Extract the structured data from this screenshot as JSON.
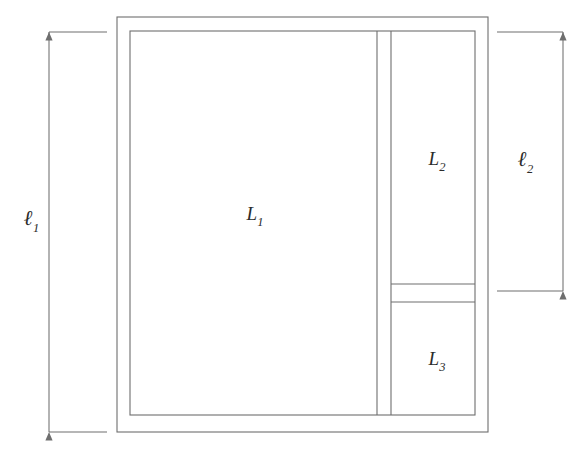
{
  "figure": {
    "type": "architectural-floor-plan",
    "background_color": "#ffffff",
    "line_color": "#6e6e6e",
    "text_color": "#2b2b2b",
    "rooms": [
      {
        "id": "L1",
        "name": "room-l1",
        "label": "L",
        "subscript": "1",
        "label_x": 255,
        "label_y": 220
      },
      {
        "id": "L2",
        "name": "room-l2",
        "label": "L",
        "subscript": "2",
        "label_x": 437,
        "label_y": 165
      },
      {
        "id": "L3",
        "name": "room-l3",
        "label": "L",
        "subscript": "3",
        "label_x": 437,
        "label_y": 365
      }
    ],
    "dimensions": [
      {
        "id": "l1",
        "name": "dimension-l1",
        "label": "ℓ",
        "subscript": "1",
        "orientation": "vertical",
        "side": "left",
        "label_x": 28,
        "label_y": 225,
        "line_x": 49,
        "from_y": 32,
        "to_y": 432,
        "extension_from_x": 49,
        "extension_to_x": 107
      },
      {
        "id": "l2",
        "name": "dimension-l2",
        "label": "ℓ",
        "subscript": "2",
        "orientation": "vertical",
        "side": "right",
        "label_x": 524,
        "label_y": 166,
        "line_x": 563,
        "from_y": 32,
        "to_y": 291,
        "extension_from_x": 497,
        "extension_to_x": 563
      }
    ],
    "geometry": {
      "outer_left": 117,
      "outer_right": 488,
      "outer_top": 17,
      "outer_bottom": 432,
      "inner_left": 130,
      "inner_right": 475,
      "inner_top": 31,
      "inner_bottom": 415,
      "partition_x_left": 377,
      "partition_x_right": 391,
      "divider_y_top": 284,
      "divider_y_bottom": 302
    }
  }
}
